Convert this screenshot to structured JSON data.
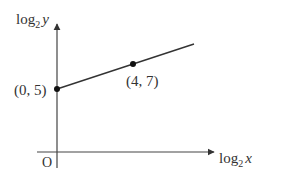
{
  "diagram": {
    "type": "linear graph on log-log axes",
    "y_axis": {
      "label": "log",
      "base": "2",
      "var": "y"
    },
    "x_axis": {
      "label": "log",
      "base": "2",
      "var": "x"
    },
    "origin_label": "O",
    "points": [
      {
        "x": 0,
        "y": 5,
        "label": "(0, 5)"
      },
      {
        "x": 4,
        "y": 7,
        "label": "(4, 7)"
      }
    ],
    "line_color": "#333333"
  }
}
